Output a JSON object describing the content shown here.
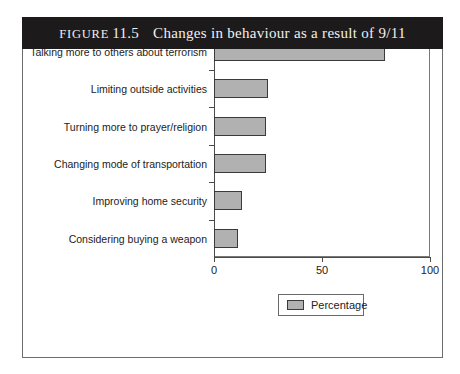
{
  "figure": {
    "label_word": "Figure",
    "number": "11.5",
    "title": "Changes in behaviour as a result of 9/11",
    "caption_full": "Figure 11.5   Changes in behaviour as a result of 9/11"
  },
  "colors": {
    "caption_bar": "#1c1a1b",
    "caption_text": "#f2f0ee",
    "bar_fill": "#b1b1b1",
    "bar_edge": "#3a3a3a",
    "axis": "#4a4a4a",
    "frame": "#6d6d6d",
    "page_background": "#ffffff"
  },
  "legend": {
    "label": "Percentage",
    "position": "bottom-center"
  },
  "chart_data": {
    "type": "bar",
    "orientation": "horizontal",
    "title": "Changes in behaviour as a result of 9/11",
    "xlabel": "",
    "ylabel": "",
    "xlim": [
      0,
      100
    ],
    "xticks": [
      0,
      50,
      100
    ],
    "xtick_labels": [
      "0",
      "50",
      "100"
    ],
    "grid": false,
    "legend_entries": [
      "Percentage"
    ],
    "categories": [
      "Talking more to others about terrorism",
      "Limiting outside activities",
      "Turning more to prayer/religion",
      "Changing mode of transportation",
      "Improving home security",
      "Considering buying a weapon"
    ],
    "values": [
      79,
      25,
      24,
      24,
      13,
      11
    ],
    "series": [
      {
        "name": "Percentage",
        "values": [
          79,
          25,
          24,
          24,
          13,
          11
        ]
      }
    ]
  }
}
